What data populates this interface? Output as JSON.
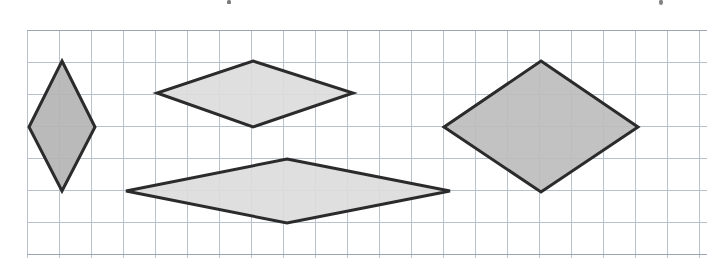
{
  "page": {
    "width": 724,
    "height": 268,
    "background_color": "#ffffff"
  },
  "clipped_text_above": {
    "note": "bottom ink fragments of a cut-off text line at the very top edge",
    "fragments": [
      {
        "name": "descender-left",
        "x": 227,
        "y": 0,
        "color": "#4a4a4a"
      },
      {
        "name": "descender-right",
        "x": 659,
        "y": 0,
        "color": "#555555"
      }
    ]
  },
  "grid": {
    "line_color": "#b9c2cc",
    "line_color_strong": "#9aa5b1",
    "line_width": 1,
    "cell_size": 32,
    "origin_x": 27,
    "origin_y": 30,
    "columns": 21,
    "rows": 7,
    "x_start": 27,
    "x_end": 707,
    "y_start": 30,
    "y_end": 258
  },
  "chart_data": {
    "type": "scatter",
    "title": "",
    "xlabel": "",
    "ylabel": "",
    "grid": true,
    "legend": "none",
    "xlim": [
      0,
      724
    ],
    "ylim": [
      268,
      0
    ],
    "shapes": [
      {
        "name": "rhombus-narrow-vertical",
        "label": "Rhombus 1",
        "fill": "#b4b4b4",
        "stroke": "#2b2b2b",
        "stroke_width": 3,
        "vertices": [
          [
            62,
            61
          ],
          [
            95,
            127
          ],
          [
            62,
            191
          ],
          [
            29,
            127
          ]
        ],
        "diagonal_horizontal_px": 66,
        "diagonal_vertical_px": 130,
        "diagonal_horizontal_cells": 2,
        "diagonal_vertical_cells": 4
      },
      {
        "name": "rhombus-upper-middle",
        "label": "Rhombus 2",
        "fill": "#dcdcdc",
        "stroke": "#2b2b2b",
        "stroke_width": 3,
        "vertices": [
          [
            253,
            61
          ],
          [
            353,
            93
          ],
          [
            253,
            127
          ],
          [
            157,
            93
          ]
        ],
        "diagonal_horizontal_px": 196,
        "diagonal_vertical_px": 66,
        "diagonal_horizontal_cells": 6,
        "diagonal_vertical_cells": 2
      },
      {
        "name": "rhombus-lower-middle-flat",
        "label": "Rhombus 3",
        "fill": "#dcdcdc",
        "stroke": "#2b2b2b",
        "stroke_width": 3,
        "vertices": [
          [
            287,
            159
          ],
          [
            450,
            191
          ],
          [
            287,
            223
          ],
          [
            126,
            191
          ]
        ],
        "diagonal_horizontal_px": 324,
        "diagonal_vertical_px": 64,
        "diagonal_horizontal_cells": 10,
        "diagonal_vertical_cells": 2
      },
      {
        "name": "rhombus-large-right",
        "label": "Rhombus 4",
        "fill": "#bdbdbd",
        "stroke": "#2b2b2b",
        "stroke_width": 3,
        "vertices": [
          [
            541,
            61
          ],
          [
            638,
            127
          ],
          [
            541,
            192
          ],
          [
            444,
            127
          ]
        ],
        "diagonal_horizontal_px": 194,
        "diagonal_vertical_px": 131,
        "diagonal_horizontal_cells": 6,
        "diagonal_vertical_cells": 4
      }
    ]
  }
}
